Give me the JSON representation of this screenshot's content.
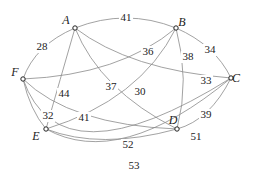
{
  "diagram": {
    "type": "weighted-graph",
    "nodes": [
      {
        "id": "A",
        "label": "A",
        "x": 75,
        "y": 28,
        "lx": 66,
        "ly": 24
      },
      {
        "id": "B",
        "label": "B",
        "x": 176,
        "y": 28,
        "lx": 182,
        "ly": 26
      },
      {
        "id": "C",
        "label": "C",
        "x": 231,
        "y": 78,
        "lx": 236,
        "ly": 82
      },
      {
        "id": "D",
        "label": "D",
        "x": 177,
        "y": 129,
        "lx": 173,
        "ly": 124
      },
      {
        "id": "E",
        "label": "E",
        "x": 46,
        "y": 129,
        "lx": 36,
        "ly": 140
      },
      {
        "id": "F",
        "label": "F",
        "x": 23,
        "y": 79,
        "lx": 15,
        "ly": 76
      }
    ],
    "edges": [
      {
        "from": "A",
        "to": "B",
        "weight": "41",
        "path": "M75,28 Q126,8 176,28",
        "lx": 126,
        "ly": 18
      },
      {
        "from": "A",
        "to": "F",
        "weight": "28",
        "path": "M75,28 Q35,45 23,79",
        "lx": 42,
        "ly": 47
      },
      {
        "from": "A",
        "to": "E",
        "weight": "44",
        "path": "M75,28 Q60,80 46,129",
        "lx": 64,
        "ly": 94
      },
      {
        "from": "A",
        "to": "D",
        "weight": "37",
        "path": "M75,28 Q100,90 177,129",
        "lx": 111,
        "ly": 87
      },
      {
        "from": "A",
        "to": "C",
        "weight": "33",
        "path": "M75,28 Q130,70 231,78",
        "lx": 206,
        "ly": 81
      },
      {
        "from": "B",
        "to": "F",
        "weight": "36",
        "path": "M176,28 Q120,75 23,79",
        "lx": 148,
        "ly": 52
      },
      {
        "from": "B",
        "to": "C",
        "weight": "34",
        "path": "M176,28 Q215,45 231,78",
        "lx": 210,
        "ly": 50
      },
      {
        "from": "B",
        "to": "D",
        "weight": "38",
        "path": "M176,28 Q190,80 177,129",
        "lx": 188,
        "ly": 57
      },
      {
        "from": "B",
        "to": "E",
        "weight": "30",
        "path": "M176,28 Q140,100 46,129",
        "lx": 140,
        "ly": 92
      },
      {
        "from": "F",
        "to": "E",
        "weight": "32",
        "path": "M23,79 Q30,110 46,129",
        "lx": 48,
        "ly": 116
      },
      {
        "from": "F",
        "to": "D",
        "weight": "41",
        "path": "M23,79 Q70,125 177,129",
        "lx": 84,
        "ly": 118
      },
      {
        "from": "C",
        "to": "D",
        "weight": "39",
        "path": "M231,78 Q210,120 177,129",
        "lx": 206,
        "ly": 115
      },
      {
        "from": "E",
        "to": "D",
        "weight": "52",
        "path": "M46,129 Q100,150 177,129",
        "lx": 128,
        "ly": 145
      },
      {
        "from": "E",
        "to": "C",
        "weight": "51",
        "path": "M46,129 Q120,170 231,78",
        "lx": 196,
        "ly": 137
      },
      {
        "from": "F",
        "to": "C",
        "weight": "53",
        "path": "M23,79 Q60,185 231,78",
        "lx": 134,
        "ly": 166
      }
    ]
  }
}
